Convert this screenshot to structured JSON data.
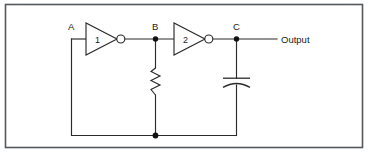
{
  "figure": {
    "kind": "schematic-diagram",
    "background_color": "#ffffff",
    "line_color": "#2b2b2b",
    "frame_color": "#55585c"
  },
  "labels": {
    "node_a": "A",
    "node_b": "B",
    "node_c": "C",
    "output": "Output"
  },
  "components": {
    "inverter_1": {
      "number": "1",
      "type": "inverter-gate"
    },
    "inverter_2": {
      "number": "2",
      "type": "inverter-gate"
    },
    "resistor": {
      "type": "resistor",
      "label": ""
    },
    "capacitor": {
      "type": "capacitor",
      "label": ""
    }
  },
  "nodes": [
    {
      "name": "A",
      "label": "A"
    },
    {
      "name": "B",
      "label": "B"
    },
    {
      "name": "C",
      "label": "C"
    }
  ]
}
